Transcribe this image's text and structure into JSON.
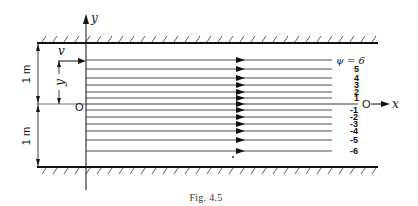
{
  "figure": {
    "caption": "Fig. 4.5",
    "axis_y_label": "y",
    "axis_x_label": "x",
    "origin_label": "O",
    "origin_label_right": "O",
    "velocity_label": "v",
    "y_dim_label": "y",
    "upper_half_height_label": "1 m",
    "lower_half_height_label": "1 m",
    "psi_label": "ψ = 6"
  },
  "streamlines": [
    {
      "psi": "6",
      "y": 60,
      "label": ""
    },
    {
      "psi": "5",
      "y": 69,
      "label": "5"
    },
    {
      "psi": "4",
      "y": 78,
      "label": "4"
    },
    {
      "psi": "3",
      "y": 85,
      "label": "3"
    },
    {
      "psi": "2",
      "y": 92,
      "label": "2"
    },
    {
      "psi": "1",
      "y": 98,
      "label": "1"
    },
    {
      "psi": "0",
      "y": 104,
      "label": ""
    },
    {
      "psi": "-1",
      "y": 110,
      "label": "-1"
    },
    {
      "psi": "-2",
      "y": 117,
      "label": "-2"
    },
    {
      "psi": "-3",
      "y": 124,
      "label": "-3"
    },
    {
      "psi": "-4",
      "y": 131,
      "label": "-4"
    },
    {
      "psi": "-5",
      "y": 140,
      "label": "-5"
    },
    {
      "psi": "-6",
      "y": 151,
      "label": "-6"
    }
  ]
}
